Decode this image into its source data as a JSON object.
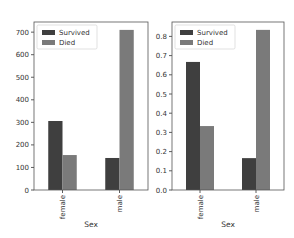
{
  "chart_data": [
    {
      "type": "bar",
      "title": "",
      "xlabel": "Sex",
      "ylabel": "",
      "categories": [
        "female",
        "male"
      ],
      "series": [
        {
          "name": "Survived",
          "values": [
            306,
            142
          ],
          "color": "#3f3f3f"
        },
        {
          "name": "Died",
          "values": [
            155,
            710
          ],
          "color": "#7a7a7a"
        }
      ],
      "yticks": [
        "0",
        "100",
        "200",
        "300",
        "400",
        "500",
        "600",
        "700"
      ],
      "ylim": [
        0,
        745
      ],
      "legend_position": "upper left",
      "grid": false
    },
    {
      "type": "bar",
      "title": "",
      "xlabel": "Sex",
      "ylabel": "",
      "categories": [
        "female",
        "male"
      ],
      "series": [
        {
          "name": "Survived",
          "values": [
            0.667,
            0.166
          ],
          "color": "#3f3f3f"
        },
        {
          "name": "Died",
          "values": [
            0.333,
            0.834
          ],
          "color": "#7a7a7a"
        }
      ],
      "yticks": [
        "0.0",
        "0.1",
        "0.2",
        "0.3",
        "0.4",
        "0.5",
        "0.6",
        "0.7",
        "0.8"
      ],
      "ylim": [
        0,
        0.875
      ],
      "legend_position": "upper left",
      "grid": false
    }
  ]
}
